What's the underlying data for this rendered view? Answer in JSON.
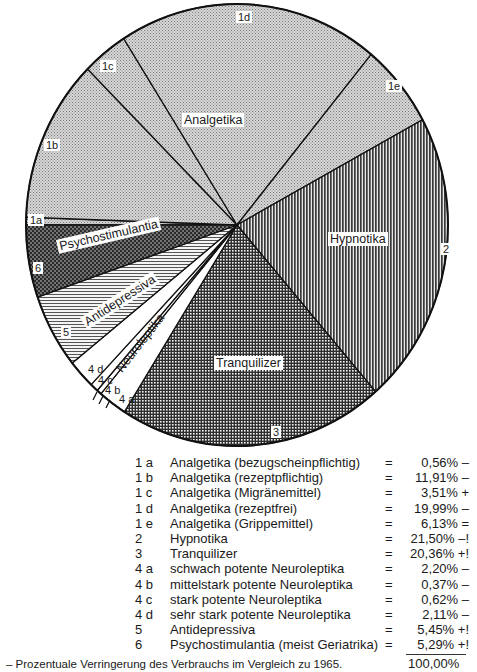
{
  "chart_data": {
    "type": "pie",
    "title": "",
    "start_angle_deg": 180,
    "direction": "clockwise",
    "slices": [
      {
        "code": "1a",
        "label": "Analgetika (bezugscheinpflichtig)",
        "value": 0.56,
        "trend": "–",
        "pattern": "fine-dots-light"
      },
      {
        "code": "1b",
        "label": "Analgetika (rezeptpflichtig)",
        "value": 11.91,
        "trend": "–",
        "pattern": "fine-dots-light"
      },
      {
        "code": "1c",
        "label": "Analgetika (Migränemittel)",
        "value": 3.51,
        "trend": "+",
        "pattern": "fine-dots-light"
      },
      {
        "code": "1d",
        "label": "Analgetika (rezeptfrei)",
        "value": 19.99,
        "trend": "–",
        "pattern": "fine-dots-light"
      },
      {
        "code": "1e",
        "label": "Analgetika (Grippemittel)",
        "value": 6.13,
        "trend": "=",
        "pattern": "fine-dots-light"
      },
      {
        "code": "2",
        "label": "Hypnotika",
        "value": 21.5,
        "trend": "–!",
        "pattern": "vertical-lines"
      },
      {
        "code": "3",
        "label": "Tranquilizer",
        "value": 20.36,
        "trend": "+!",
        "pattern": "grid"
      },
      {
        "code": "4a",
        "label": "schwach potente Neuroleptika",
        "value": 2.2,
        "trend": "–",
        "pattern": "white"
      },
      {
        "code": "4b",
        "label": "mittelstark potente Neuroleptika",
        "value": 0.37,
        "trend": "–",
        "pattern": "white"
      },
      {
        "code": "4c",
        "label": "stark potente Neuroleptika",
        "value": 0.62,
        "trend": "–",
        "pattern": "white"
      },
      {
        "code": "4d",
        "label": "sehr stark potente Neuroleptika",
        "value": 2.11,
        "trend": "–",
        "pattern": "white"
      },
      {
        "code": "5",
        "label": "Antidepressiva",
        "value": 5.45,
        "trend": "+!",
        "pattern": "horizontal-lines"
      },
      {
        "code": "6",
        "label": "Psychostimulantia (meist Geriatrika)",
        "value": 5.29,
        "trend": "+!",
        "pattern": "dark-dots"
      }
    ],
    "group_labels": [
      "Analgetika",
      "Hypnotika",
      "Tranquilizer",
      "Neuroleptika",
      "Antidepressiva",
      "Psychostimulantia"
    ],
    "total": "100,00%",
    "footnote": "– Prozentuale Verringerung des Verbrauchs im Vergleich zu 1965."
  },
  "pie_labels": {
    "analgetika": "Analgetika",
    "hypnotika": "Hypnotika",
    "tranquilizer": "Tranquilizer",
    "neuroleptika": "Neuroleptika",
    "antidepressiva": "Antidepressiva",
    "psychostimulantia": "Psychostimulantia",
    "c1a": "1a",
    "c1b": "1b",
    "c1c": "1c",
    "c1d": "1d",
    "c1e": "1e",
    "c2": "2",
    "c3": "3",
    "c4a": "4 a",
    "c4b": "4 b",
    "c4c": "4 c",
    "c4d": "4 d",
    "c5": "5",
    "c6": "6"
  },
  "legend": {
    "rows": [
      {
        "code": "1 a",
        "name": "Analgetika (bezugscheinpflichtig)",
        "eq": "=",
        "val": "0,56% –"
      },
      {
        "code": "1 b",
        "name": "Analgetika (rezeptpflichtig)",
        "eq": "=",
        "val": "11,91% –"
      },
      {
        "code": "1 c",
        "name": "Analgetika (Migränemittel)",
        "eq": "=",
        "val": "3,51% +"
      },
      {
        "code": "1 d",
        "name": "Analgetika (rezeptfrei)",
        "eq": "=",
        "val": "19,99% –"
      },
      {
        "code": "1 e",
        "name": "Analgetika (Grippemittel)",
        "eq": "=",
        "val": "6,13% ="
      },
      {
        "code": "2",
        "name": "Hypnotika",
        "eq": "=",
        "val": "21,50% –!"
      },
      {
        "code": "3",
        "name": "Tranquilizer",
        "eq": "=",
        "val": "20,36% +!"
      },
      {
        "code": "4 a",
        "name": "schwach potente Neuroleptika",
        "eq": "=",
        "val": "2,20% –"
      },
      {
        "code": "4 b",
        "name": "mittelstark potente Neuroleptika",
        "eq": "=",
        "val": "0,37% –"
      },
      {
        "code": "4 c",
        "name": "stark potente Neuroleptika",
        "eq": "=",
        "val": "0,62% –"
      },
      {
        "code": "4 d",
        "name": "sehr stark potente Neuroleptika",
        "eq": "=",
        "val": "2,11% –"
      },
      {
        "code": "5",
        "name": "Antidepressiva",
        "eq": "=",
        "val": "5,45% +!"
      },
      {
        "code": "6",
        "name": "Psychostimulantia (meist Geriatrika)",
        "eq": "=",
        "val": "5,29% +!"
      }
    ],
    "total": "100,00%",
    "footnote": "– Prozentuale Verringerung des Verbrauchs im Vergleich zu 1965."
  }
}
